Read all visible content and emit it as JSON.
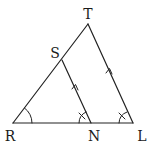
{
  "diagram": {
    "type": "geometry-triangle",
    "colors": {
      "stroke": "#222222",
      "label": "#1a1a1a",
      "background": "#ffffff"
    },
    "points": [
      {
        "id": "T",
        "label": "T",
        "x": 88,
        "y": 24,
        "label_x": 88,
        "label_y": 19
      },
      {
        "id": "S",
        "label": "S",
        "x": 62,
        "y": 60,
        "label_x": 55,
        "label_y": 58
      },
      {
        "id": "R",
        "label": "R",
        "x": 13,
        "y": 123,
        "label_x": 10,
        "label_y": 141
      },
      {
        "id": "N",
        "label": "N",
        "x": 91,
        "y": 123,
        "label_x": 93,
        "label_y": 141
      },
      {
        "id": "L",
        "label": "L",
        "x": 133,
        "y": 123,
        "label_x": 142,
        "label_y": 141
      }
    ],
    "segments": [
      {
        "from": "R",
        "to": "T"
      },
      {
        "from": "T",
        "to": "L"
      },
      {
        "from": "R",
        "to": "L"
      },
      {
        "from": "S",
        "to": "N"
      }
    ],
    "parallel_marks": [
      {
        "segment": "SN",
        "style": "single-arrow"
      },
      {
        "segment": "TL",
        "style": "single-arrow"
      }
    ],
    "angle_marks": [
      {
        "vertex": "R",
        "style": "arc"
      },
      {
        "vertex": "N",
        "style": "arc-with-tick"
      },
      {
        "vertex": "L",
        "style": "arc-with-tick"
      }
    ]
  }
}
